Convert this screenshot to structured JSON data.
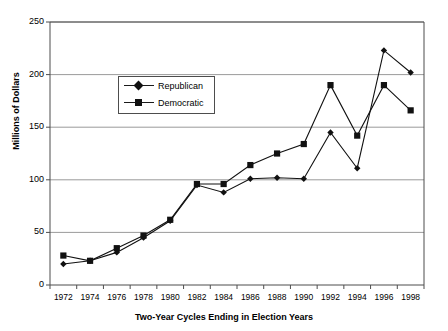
{
  "chart_data": {
    "type": "line",
    "title": "",
    "xlabel": "Two-Year Cycles Ending in Election Years",
    "ylabel": "Millions of Dollars",
    "categories": [
      "1972",
      "1974",
      "1976",
      "1978",
      "1980",
      "1982",
      "1984",
      "1986",
      "1988",
      "1990",
      "1992",
      "1994",
      "1996",
      "1998"
    ],
    "ylim": [
      0,
      250
    ],
    "yticks": [
      0,
      50,
      100,
      150,
      200,
      250
    ],
    "ytick_labels": [
      "0",
      "50",
      "100",
      "150",
      "200",
      "250"
    ],
    "grid": "horizontal",
    "legend_position": "inside-upper-left",
    "series": [
      {
        "name": "Republican",
        "marker": "diamond",
        "color": "#111111",
        "values": [
          20,
          23,
          31,
          45,
          61,
          95,
          88,
          101,
          102,
          101,
          145,
          111,
          223,
          202
        ]
      },
      {
        "name": "Democratic",
        "marker": "square",
        "color": "#111111",
        "values": [
          28,
          23,
          35,
          47,
          62,
          96,
          96,
          114,
          125,
          134,
          190,
          142,
          190,
          166
        ]
      }
    ]
  },
  "axes": {
    "y_axis_title": "Millions of Dollars",
    "x_axis_title": "Two-Year Cycles Ending in Election Years"
  },
  "legend": {
    "items": [
      {
        "label": "Republican",
        "marker": "diamond"
      },
      {
        "label": "Democratic",
        "marker": "square"
      }
    ]
  },
  "colors": {
    "line": "#111111",
    "grid": "#808080",
    "frame": "#4d4d4d",
    "text": "#000000",
    "background": "#ffffff"
  }
}
